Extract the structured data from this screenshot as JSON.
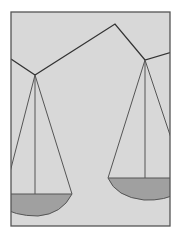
{
  "image": {
    "subject": "balance scale illustration",
    "colors": {
      "page": "#ffffff",
      "panel": "#d8d8d8",
      "frame": "#555555",
      "line": "#333333",
      "pan": "#a0a0a0"
    }
  }
}
